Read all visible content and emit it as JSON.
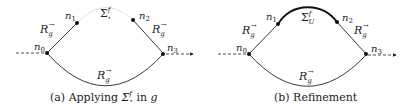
{
  "figure": {
    "panels": [
      {
        "id": "a",
        "caption_prefix": "(a) Applying ",
        "caption_sigma": "Σ",
        "caption_sigma_sup": "f",
        "caption_sigma_sub": "⋆",
        "caption_mid": " in ",
        "caption_var": "g",
        "nodes": {
          "n0": "n",
          "n0_sub": "0",
          "n1": "n",
          "n1_sub": "1",
          "n2": "n",
          "n2_sub": "2",
          "n3": "n",
          "n3_sub": "3"
        },
        "edge_labels": {
          "left": "R",
          "right": "R",
          "bottom": "R",
          "sub": "g",
          "sup": "→"
        },
        "top_label": {
          "base": "Σ",
          "sup": "f",
          "sub": "⋆"
        },
        "top_edge_style": "dotted-gray"
      },
      {
        "id": "b",
        "caption": "(b) Refinement",
        "nodes": {
          "n0": "n",
          "n0_sub": "0",
          "n1": "n",
          "n1_sub": "1",
          "n2": "n",
          "n2_sub": "2",
          "n3": "n",
          "n3_sub": "3"
        },
        "edge_labels": {
          "left": "R",
          "right": "R",
          "bottom": "R",
          "sub": "g",
          "sup": "→"
        },
        "top_label": {
          "base": "Σ",
          "sup": "f",
          "sub": "U"
        },
        "top_edge_style": "solid-bold"
      }
    ]
  }
}
